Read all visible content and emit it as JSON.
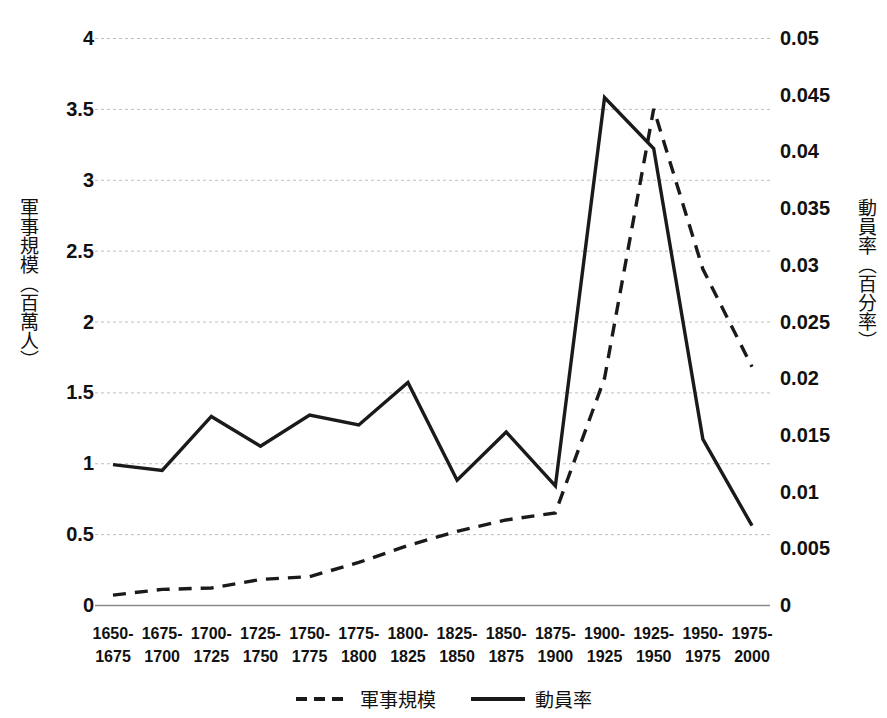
{
  "axes": {
    "left_title": "軍事規模（百萬人）",
    "right_title": "動員率（百分率）",
    "left_ticks": [
      "4",
      "3.5",
      "3",
      "2.5",
      "2",
      "1.5",
      "1",
      "0.5",
      "0"
    ],
    "right_ticks": [
      "0.05",
      "0.045",
      "0.04",
      "0.035",
      "0.03",
      "0.025",
      "0.02",
      "0.015",
      "0.01",
      "0.005",
      "0"
    ]
  },
  "legend": {
    "items": [
      {
        "label": "軍事規模",
        "style": "dashed",
        "color": "#1a1a1a"
      },
      {
        "label": "動員率",
        "style": "solid",
        "color": "#1a1a1a"
      }
    ]
  },
  "chart_data": {
    "type": "line",
    "title": "",
    "xlabel": "",
    "ylabel": "軍事規模（百萬人）",
    "y2label": "動員率（百分率）",
    "grid": true,
    "legend_position": "bottom",
    "categories": [
      "1650-\n1675",
      "1675-\n1700",
      "1700-\n1725",
      "1725-\n1750",
      "1750-\n1775",
      "1775-\n1800",
      "1800-\n1825",
      "1825-\n1850",
      "1850-\n1875",
      "1875-\n1900",
      "1900-\n1925",
      "1925-\n1950",
      "1950-\n1975",
      "1975-\n2000"
    ],
    "categories_flat": [
      "1650-1675",
      "1675-1700",
      "1700-1725",
      "1725-1750",
      "1750-1775",
      "1775-1800",
      "1800-1825",
      "1825-1850",
      "1850-1875",
      "1875-1900",
      "1900-1925",
      "1925-1950",
      "1950-1975",
      "1975-2000"
    ],
    "ylim": [
      0,
      4
    ],
    "y2lim": [
      0,
      0.05
    ],
    "yticks": [
      0,
      0.5,
      1,
      1.5,
      2,
      2.5,
      3,
      3.5,
      4
    ],
    "y2ticks": [
      0,
      0.005,
      0.01,
      0.015,
      0.02,
      0.025,
      0.03,
      0.035,
      0.04,
      0.045,
      0.05
    ],
    "series": [
      {
        "name": "軍事規模",
        "axis": "left",
        "unit": "百萬人",
        "style": "dashed",
        "color": "#1a1a1a",
        "values": [
          0.07,
          0.11,
          0.12,
          0.18,
          0.2,
          0.3,
          0.42,
          0.52,
          0.6,
          0.65,
          1.6,
          3.5,
          2.37,
          1.68
        ]
      },
      {
        "name": "動員率",
        "axis": "right",
        "unit": "百分率",
        "style": "solid",
        "color": "#1a1a1a",
        "values_left_scale": [
          0.99,
          0.95,
          1.33,
          1.12,
          1.34,
          1.27,
          1.57,
          0.88,
          1.22,
          0.84,
          3.58,
          3.22,
          1.17,
          0.56
        ],
        "values": [
          0.0124,
          0.0119,
          0.0166,
          0.014,
          0.0168,
          0.0159,
          0.0196,
          0.011,
          0.0153,
          0.0105,
          0.0448,
          0.0403,
          0.0146,
          0.007
        ]
      }
    ]
  }
}
